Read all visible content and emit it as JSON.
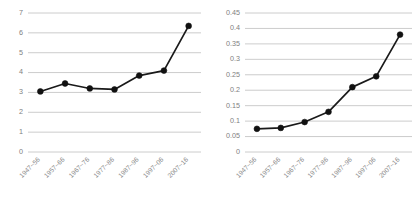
{
  "figure": {
    "background_color": "#ffffff",
    "gridline_color": "#bfbfbf",
    "line_color": "#111111",
    "tick_label_color": "#808080"
  },
  "chart_data": [
    {
      "id": "left-chart",
      "type": "line",
      "title": "",
      "subtitle": "",
      "xlabel": "",
      "ylabel": "",
      "categories": [
        "1947~56",
        "1957~66",
        "1967~76",
        "1977~86",
        "1987~96",
        "1997~06",
        "2007~16"
      ],
      "values": [
        3.05,
        3.45,
        3.2,
        3.15,
        3.85,
        4.1,
        6.35
      ],
      "ylim": [
        0,
        7
      ],
      "yticks": [
        0,
        1,
        2,
        3,
        4,
        5,
        6,
        7
      ],
      "ytick_labels": [
        "0",
        "1",
        "2",
        "3",
        "4",
        "5",
        "6",
        "7"
      ],
      "grid": true,
      "grid_axis": "y",
      "legend": false,
      "marker": "circle",
      "xtick_rotation": 45
    },
    {
      "id": "right-chart",
      "type": "line",
      "title": "",
      "subtitle": "",
      "xlabel": "",
      "ylabel": "",
      "categories": [
        "1947~56",
        "1957~66",
        "1967~76",
        "1977~86",
        "1987~96",
        "1997~06",
        "2007~16"
      ],
      "values": [
        0.075,
        0.078,
        0.097,
        0.13,
        0.21,
        0.245,
        0.38
      ],
      "ylim": [
        0,
        0.45
      ],
      "yticks": [
        0,
        0.05,
        0.1,
        0.15,
        0.2,
        0.25,
        0.3,
        0.35,
        0.4,
        0.45
      ],
      "ytick_labels": [
        "0",
        "0.05",
        "0.1",
        "0.15",
        "0.2",
        "0.25",
        "0.3",
        "0.35",
        "0.4",
        "0.45"
      ],
      "grid": true,
      "grid_axis": "y",
      "legend": false,
      "marker": "circle",
      "xtick_rotation": 45
    }
  ]
}
